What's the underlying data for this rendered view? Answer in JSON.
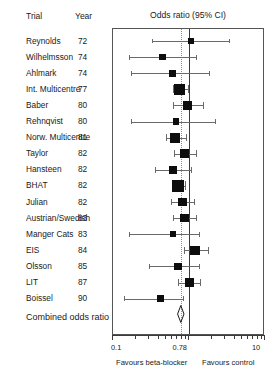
{
  "table": {
    "header": {
      "trial": "Trial",
      "year": "Year"
    },
    "combined_label": "Combined odds ratio"
  },
  "plot": {
    "title": "Odds ratio (95% CI)",
    "footer_left": "Favours beta-blocker",
    "footer_right": "Favours control",
    "axis_labels": {
      "min": "0.1",
      "pooled": "0.78",
      "max": "10"
    },
    "null_value": 1.0,
    "pooled_value": 0.78,
    "axis_min": 0.1,
    "axis_max": 10,
    "scale": "log"
  },
  "chart_data": {
    "type": "forest",
    "title": "Odds ratio (95% CI)",
    "xlabel": "Odds ratio",
    "xlim": [
      0.1,
      10
    ],
    "xscale": "log",
    "xticks": [
      0.1,
      0.78,
      10
    ],
    "xticklabels": [
      "0.1",
      "0.78",
      "10"
    ],
    "reference_line": 1.0,
    "pooled_line": 0.78,
    "grid": false,
    "legend": null,
    "columns": [
      "Trial",
      "Year",
      "Odds ratio (95% CI)"
    ],
    "annotations": {
      "left": "Favours beta-blocker",
      "right": "Favours control",
      "summary_row": "Combined odds ratio"
    },
    "studies": [
      {
        "trial": "Reynolds",
        "year": "72",
        "or": 1.05,
        "ci_low": 0.33,
        "ci_high": 3.4,
        "weight": 1.5
      },
      {
        "trial": "Wilhelmsson",
        "year": "74",
        "or": 0.45,
        "ci_low": 0.16,
        "ci_high": 1.22,
        "weight": 2.0
      },
      {
        "trial": "Ahlmark",
        "year": "74",
        "or": 0.6,
        "ci_low": 0.17,
        "ci_high": 1.85,
        "weight": 2.2
      },
      {
        "trial": "Int. Multicentre",
        "year": "77",
        "or": 0.75,
        "ci_low": 0.62,
        "ci_high": 0.96,
        "weight": 9.0
      },
      {
        "trial": "Baber",
        "year": "80",
        "or": 0.95,
        "ci_low": 0.62,
        "ci_high": 1.55,
        "weight": 4.5
      },
      {
        "trial": "Rehnqvist",
        "year": "80",
        "or": 0.68,
        "ci_low": 0.17,
        "ci_high": 2.2,
        "weight": 1.6
      },
      {
        "trial": "Norw. Multicentre",
        "year": "81",
        "or": 0.65,
        "ci_low": 0.5,
        "ci_high": 0.9,
        "weight": 7.5
      },
      {
        "trial": "Taylor",
        "year": "82",
        "or": 0.88,
        "ci_low": 0.63,
        "ci_high": 1.25,
        "weight": 5.0
      },
      {
        "trial": "Hansteen",
        "year": "82",
        "or": 0.62,
        "ci_low": 0.36,
        "ci_high": 1.05,
        "weight": 3.6
      },
      {
        "trial": "BHAT",
        "year": "82",
        "or": 0.72,
        "ci_low": 0.6,
        "ci_high": 0.88,
        "weight": 12.0
      },
      {
        "trial": "Julian",
        "year": "82",
        "or": 0.82,
        "ci_low": 0.58,
        "ci_high": 1.18,
        "weight": 5.2
      },
      {
        "trial": "Austrian/Swedish",
        "year": "83",
        "or": 0.88,
        "ci_low": 0.62,
        "ci_high": 1.25,
        "weight": 4.8
      },
      {
        "trial": "Manger Cats",
        "year": "83",
        "or": 0.62,
        "ci_low": 0.16,
        "ci_high": 1.35,
        "weight": 1.8
      },
      {
        "trial": "EIS",
        "year": "84",
        "or": 1.2,
        "ci_low": 0.85,
        "ci_high": 1.8,
        "weight": 5.5
      },
      {
        "trial": "Olsson",
        "year": "85",
        "or": 0.72,
        "ci_low": 0.3,
        "ci_high": 1.35,
        "weight": 2.8
      },
      {
        "trial": "LIT",
        "year": "87",
        "or": 1.02,
        "ci_low": 0.72,
        "ci_high": 1.4,
        "weight": 6.2
      },
      {
        "trial": "Boissel",
        "year": "90",
        "or": 0.42,
        "ci_low": 0.14,
        "ci_high": 0.84,
        "weight": 2.4
      }
    ],
    "summary": {
      "label": "Combined odds ratio",
      "or": 0.78,
      "ci_low": 0.71,
      "ci_high": 0.86
    }
  }
}
